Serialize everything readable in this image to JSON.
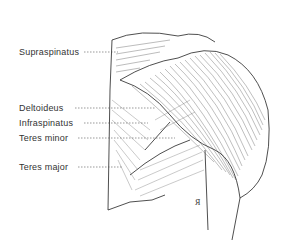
{
  "figure": {
    "labels": [
      {
        "text": "Supraspinatus",
        "x": 19,
        "y": 47,
        "line_end": 118
      },
      {
        "text": "Deltoideus",
        "x": 19,
        "y": 103,
        "line_end": 155
      },
      {
        "text": "Infraspinatus",
        "x": 19,
        "y": 118,
        "line_end": 148
      },
      {
        "text": "Teres minor",
        "x": 19,
        "y": 133,
        "line_end": 175
      },
      {
        "text": "Teres major",
        "x": 19,
        "y": 162,
        "line_end": 122
      }
    ],
    "signature": "A"
  }
}
